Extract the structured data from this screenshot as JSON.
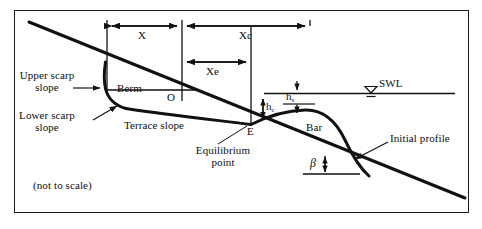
{
  "figure": {
    "note": "(not to scale)",
    "colors": {
      "ink": "#111111",
      "background": "#ffffff",
      "frame": "#1a1a1a"
    }
  },
  "labels": {
    "upper_scarp_line1": "Upper scarp",
    "upper_scarp_line2": "slope",
    "lower_scarp_line1": "Lower scarp",
    "lower_scarp_line2": "slope",
    "berm": "Berm",
    "terrace_slope": "Terrace slope",
    "point_o": "O",
    "point_e": "E",
    "equilibrium_line1": "Equilibrium",
    "equilibrium_line2": "point",
    "bar": "Bar",
    "initial_profile": "Initial profile",
    "swl": "SWL",
    "beta": "β",
    "not_to_scale": "(not to scale)"
  },
  "dimensions": {
    "x": "X",
    "xc": "Xc",
    "xe": "Xe",
    "hc_base": "h",
    "hc_sub": "c",
    "hs_base": "h",
    "hs_sub": "s"
  },
  "icons": {
    "swl_marker": "water-level-triangle-icon",
    "dimension_arrow": "double-headed-arrow-icon",
    "leader_arrow": "leader-arrow-icon"
  }
}
